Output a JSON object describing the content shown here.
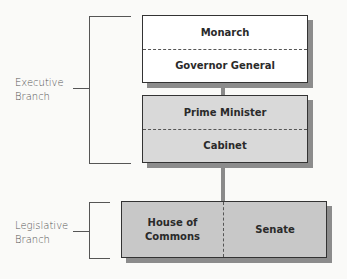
{
  "diagram": {
    "type": "hierarchy",
    "title": "",
    "branches": [
      {
        "label_line1": "Executive",
        "label_line2": "Branch"
      },
      {
        "label_line1": "Legislative",
        "label_line2": "Branch"
      }
    ],
    "boxes": {
      "crown": {
        "top": "Monarch",
        "bottom": "Governor General",
        "fill": "#ffffff"
      },
      "government": {
        "top": "Prime Minister",
        "bottom": "Cabinet",
        "fill": "#d9d9d9"
      },
      "parliament": {
        "left": "House of Commons",
        "right": "Senate",
        "fill": "#c8c8c8"
      }
    },
    "colors": {
      "shadow": "#8c8c8c",
      "connector": "#8a8a8a",
      "border": "#333333"
    }
  }
}
